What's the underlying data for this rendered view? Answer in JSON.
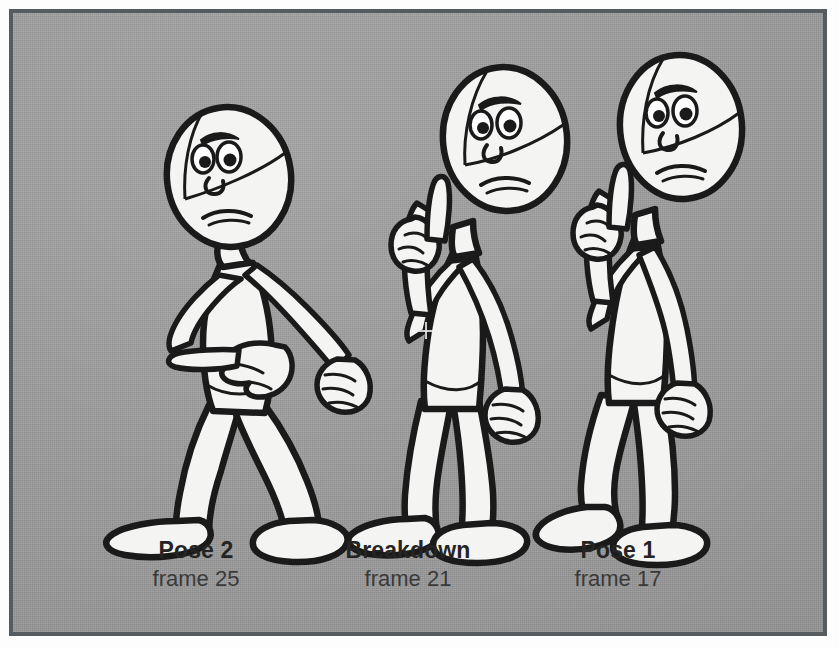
{
  "panel": {
    "background_color": "#9a9a9a",
    "border_color": "#555b5e",
    "ink_color": "#1a1a1a",
    "body_fill": "#f4f4f2",
    "description": "Three cartoon stick-figure character poses drawn side by side on a gray halftone background"
  },
  "captions": [
    {
      "id": "pose2",
      "title": "Pose 2",
      "sub": "frame 25"
    },
    {
      "id": "breakdown",
      "title": "Breakdown",
      "sub": "frame 21"
    },
    {
      "id": "pose1",
      "title": "Pose 1",
      "sub": "frame 17"
    }
  ],
  "figures": [
    {
      "name": "pose-2-figure",
      "label": "Pose 2",
      "frame": 25,
      "pose": "leaning forward, left arm extended pointing left with index finger, right arm hanging with loose fist, wide stance legs",
      "head_features": [
        "construction-guide-lines",
        "angry-eyebrow",
        "two-eyes",
        "small-nose",
        "frowning-mouth"
      ]
    },
    {
      "name": "breakdown-figure",
      "label": "Breakdown",
      "frame": 21,
      "pose": "upright transitional pose, left hand raised near head with index finger up, right arm down with loose fist, legs nearly together",
      "head_features": [
        "construction-guide-lines",
        "angry-eyebrow",
        "two-eyes",
        "small-nose",
        "frowning-mouth"
      ]
    },
    {
      "name": "pose-1-figure",
      "label": "Pose 1",
      "frame": 17,
      "pose": "standing tall, left hand raised with index finger up, right arm down with loose fist, legs in stride",
      "head_features": [
        "construction-guide-lines",
        "angry-eyebrow",
        "two-eyes",
        "small-nose",
        "frowning-mouth"
      ]
    }
  ],
  "markers": {
    "crosshair": {
      "name": "crosshair-cursor-marker",
      "x": 422,
      "y": 327
    }
  }
}
